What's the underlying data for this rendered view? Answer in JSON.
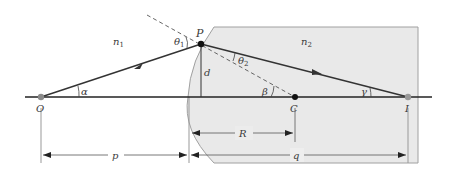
{
  "diagram": {
    "type": "optics-refraction-spherical-surface",
    "colors": {
      "background": "#ffffff",
      "medium2_fill": "#e8e8e8",
      "medium2_edge": "#9a9a9a",
      "ray": "#333333",
      "axis": "#222222",
      "dashed_normal": "#555555",
      "dimension_line": "#555555",
      "point_dark": "#111111",
      "point_gray": "#8a8a8a"
    },
    "media": {
      "n1": {
        "base": "n",
        "sub": "1"
      },
      "n2": {
        "base": "n",
        "sub": "2"
      }
    },
    "points": {
      "O": "O",
      "P": "P",
      "C": "C",
      "I": "I"
    },
    "angles": {
      "alpha": "α",
      "beta": "β",
      "gamma": "γ",
      "theta1": {
        "base": "θ",
        "sub": "1"
      },
      "theta2": {
        "base": "θ",
        "sub": "2"
      }
    },
    "lengths": {
      "d": "d",
      "R": "R",
      "p": "p",
      "q": "q"
    }
  }
}
